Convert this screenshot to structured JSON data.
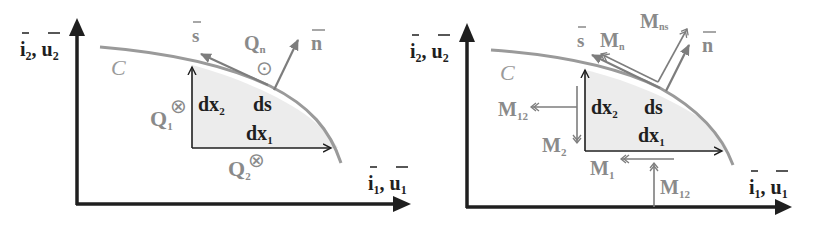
{
  "colors": {
    "axis": "#1f1f1f",
    "curve": "#9a9a9a",
    "vector_gray": "#7d7d7d",
    "fill_region": "#ececec",
    "background": "#ffffff"
  },
  "left_panel": {
    "axis_y_label": {
      "i": "i",
      "i_sub": "2",
      "sep": ",",
      "u": "u",
      "u_sub": "2"
    },
    "axis_x_label": {
      "i": "i",
      "i_sub": "1",
      "sep": ",",
      "u": "u",
      "u_sub": "1"
    },
    "curve_label": "C",
    "s_label": "s",
    "n_label": "n",
    "ds_label": "ds",
    "dx1": {
      "base": "dx",
      "sub": "1"
    },
    "dx2": {
      "base": "dx",
      "sub": "2"
    },
    "Q1": {
      "base": "Q",
      "sub": "1",
      "symbol": "⊗"
    },
    "Q2": {
      "base": "Q",
      "sub": "2",
      "symbol": "⊗"
    },
    "Qn": {
      "base": "Q",
      "sub": "n",
      "symbol": "⊙"
    }
  },
  "right_panel": {
    "axis_y_label": {
      "i": "i",
      "i_sub": "2",
      "sep": ",",
      "u": "u",
      "u_sub": "2"
    },
    "axis_x_label": {
      "i": "i",
      "i_sub": "1",
      "sep": ",",
      "u": "u",
      "u_sub": "1"
    },
    "curve_label": "C",
    "s_label": "s",
    "n_label": "n",
    "ds_label": "ds",
    "dx1": {
      "base": "dx",
      "sub": "1"
    },
    "dx2": {
      "base": "dx",
      "sub": "2"
    },
    "Mn": {
      "base": "M",
      "sub": "n"
    },
    "Mns": {
      "base": "M",
      "sub": "ns"
    },
    "M12_left": {
      "base": "M",
      "sub": "12"
    },
    "M2": {
      "base": "M",
      "sub": "2"
    },
    "M1": {
      "base": "M",
      "sub": "1"
    },
    "M12_bottom": {
      "base": "M",
      "sub": "12"
    }
  }
}
